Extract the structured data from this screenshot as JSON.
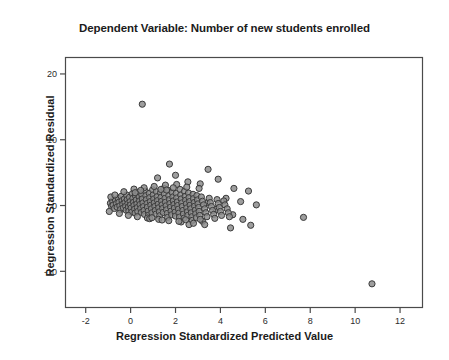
{
  "chart_data": {
    "type": "scatter",
    "title": "Dependent Variable: Number of new students enrolled",
    "xlabel": "Regression Standardized Predicted Value",
    "ylabel": "Regression Standardized Residual",
    "xlim": [
      -2.9,
      13.0
    ],
    "ylim": [
      -15.5,
      22.5
    ],
    "xticks": [
      -2,
      0,
      2,
      4,
      6,
      8,
      10,
      12
    ],
    "xtick_labels": [
      "-2",
      "0",
      "2",
      "4",
      "6",
      "8",
      "10",
      "12"
    ],
    "yticks": [
      20,
      10,
      0,
      -10
    ],
    "ytick_labels": [
      "20",
      "10",
      "0",
      "-10"
    ],
    "grid": false,
    "legend": null,
    "marker": {
      "shape": "circle",
      "fill": "#8d8d8d",
      "stroke": "#3a3a3a",
      "radius": 3.1,
      "stroke_width": 1.0
    },
    "frame_color": "#4a4a4a",
    "points": [
      [
        0.52,
        15.4
      ],
      [
        1.73,
        6.3
      ],
      [
        3.45,
        5.5
      ],
      [
        1.2,
        4.2
      ],
      [
        2.0,
        4.6
      ],
      [
        2.55,
        3.6
      ],
      [
        3.1,
        3.3
      ],
      [
        3.9,
        4.0
      ],
      [
        4.6,
        2.6
      ],
      [
        5.25,
        2.2
      ],
      [
        4.25,
        1.1
      ],
      [
        4.9,
        0.6
      ],
      [
        5.6,
        0.1
      ],
      [
        3.4,
        0.4
      ],
      [
        3.8,
        -0.6
      ],
      [
        4.55,
        -1.4
      ],
      [
        5.0,
        -2.1
      ],
      [
        5.35,
        -3.0
      ],
      [
        4.45,
        -3.4
      ],
      [
        3.2,
        -2.4
      ],
      [
        2.6,
        -2.9
      ],
      [
        7.7,
        -1.8
      ],
      [
        10.75,
        -11.9
      ],
      [
        -0.9,
        0.35
      ],
      [
        -0.85,
        -0.1
      ],
      [
        -0.8,
        0.7
      ],
      [
        -0.78,
        0.05
      ],
      [
        -0.72,
        -0.45
      ],
      [
        -0.68,
        0.9
      ],
      [
        -0.63,
        0.3
      ],
      [
        -0.6,
        -0.25
      ],
      [
        -0.55,
        1.1
      ],
      [
        -0.52,
        0.5
      ],
      [
        -0.48,
        -0.05
      ],
      [
        -0.45,
        -0.6
      ],
      [
        -0.42,
        1.4
      ],
      [
        -0.38,
        0.75
      ],
      [
        -0.35,
        0.2
      ],
      [
        -0.32,
        -0.35
      ],
      [
        -0.28,
        1.0
      ],
      [
        -0.25,
        0.45
      ],
      [
        -0.22,
        -0.1
      ],
      [
        -0.2,
        -0.7
      ],
      [
        -0.18,
        1.6
      ],
      [
        -0.15,
        0.9
      ],
      [
        -0.12,
        0.3
      ],
      [
        -0.1,
        -0.25
      ],
      [
        -0.08,
        -0.85
      ],
      [
        -0.05,
        1.25
      ],
      [
        -0.02,
        0.6
      ],
      [
        0.0,
        0.1
      ],
      [
        0.02,
        -0.4
      ],
      [
        0.05,
        -1.0
      ],
      [
        0.08,
        1.8
      ],
      [
        0.1,
        1.1
      ],
      [
        0.13,
        0.5
      ],
      [
        0.15,
        0.0
      ],
      [
        0.18,
        -0.55
      ],
      [
        0.2,
        -1.15
      ],
      [
        0.22,
        1.45
      ],
      [
        0.25,
        0.85
      ],
      [
        0.28,
        0.25
      ],
      [
        0.3,
        -0.3
      ],
      [
        0.32,
        -0.9
      ],
      [
        0.35,
        2.0
      ],
      [
        0.38,
        1.3
      ],
      [
        0.4,
        0.7
      ],
      [
        0.42,
        0.15
      ],
      [
        0.45,
        -0.45
      ],
      [
        0.48,
        -1.05
      ],
      [
        0.5,
        1.65
      ],
      [
        0.52,
        1.0
      ],
      [
        0.55,
        0.4
      ],
      [
        0.58,
        -0.15
      ],
      [
        0.6,
        -0.75
      ],
      [
        0.62,
        -1.35
      ],
      [
        0.65,
        2.2
      ],
      [
        0.68,
        1.5
      ],
      [
        0.7,
        0.9
      ],
      [
        0.73,
        0.3
      ],
      [
        0.75,
        -0.25
      ],
      [
        0.78,
        -0.85
      ],
      [
        0.8,
        -1.45
      ],
      [
        0.83,
        1.85
      ],
      [
        0.85,
        1.2
      ],
      [
        0.88,
        0.6
      ],
      [
        0.9,
        0.05
      ],
      [
        0.93,
        -0.5
      ],
      [
        0.95,
        -1.1
      ],
      [
        0.98,
        2.4
      ],
      [
        1.0,
        1.6
      ],
      [
        1.03,
        1.0
      ],
      [
        1.05,
        0.4
      ],
      [
        1.08,
        -0.15
      ],
      [
        1.1,
        -0.75
      ],
      [
        1.13,
        -1.3
      ],
      [
        1.15,
        2.1
      ],
      [
        1.18,
        1.35
      ],
      [
        1.2,
        0.75
      ],
      [
        1.23,
        0.2
      ],
      [
        1.25,
        -0.35
      ],
      [
        1.28,
        -0.95
      ],
      [
        1.3,
        -1.55
      ],
      [
        1.33,
        1.95
      ],
      [
        1.35,
        1.25
      ],
      [
        1.38,
        0.65
      ],
      [
        1.4,
        0.1
      ],
      [
        1.43,
        -0.45
      ],
      [
        1.45,
        -1.05
      ],
      [
        1.48,
        2.6
      ],
      [
        1.5,
        1.75
      ],
      [
        1.53,
        1.1
      ],
      [
        1.55,
        0.5
      ],
      [
        1.58,
        -0.05
      ],
      [
        1.6,
        -0.65
      ],
      [
        1.63,
        -1.2
      ],
      [
        1.65,
        -1.8
      ],
      [
        1.68,
        2.3
      ],
      [
        1.7,
        1.5
      ],
      [
        1.73,
        0.9
      ],
      [
        1.75,
        0.3
      ],
      [
        1.78,
        -0.25
      ],
      [
        1.8,
        -0.85
      ],
      [
        1.83,
        -1.4
      ],
      [
        1.85,
        2.0
      ],
      [
        1.88,
        1.3
      ],
      [
        1.9,
        0.7
      ],
      [
        1.93,
        0.15
      ],
      [
        1.95,
        -0.4
      ],
      [
        1.98,
        -1.0
      ],
      [
        2.0,
        -1.6
      ],
      [
        2.03,
        1.85
      ],
      [
        2.05,
        1.15
      ],
      [
        2.08,
        0.55
      ],
      [
        2.1,
        0.0
      ],
      [
        2.13,
        -0.55
      ],
      [
        2.15,
        -1.15
      ],
      [
        2.18,
        -1.75
      ],
      [
        2.2,
        2.45
      ],
      [
        2.23,
        1.6
      ],
      [
        2.25,
        1.0
      ],
      [
        2.28,
        0.4
      ],
      [
        2.3,
        -0.15
      ],
      [
        2.33,
        -0.75
      ],
      [
        2.35,
        -1.3
      ],
      [
        2.38,
        -1.9
      ],
      [
        2.4,
        2.15
      ],
      [
        2.43,
        1.4
      ],
      [
        2.45,
        0.8
      ],
      [
        2.48,
        0.25
      ],
      [
        2.5,
        -0.35
      ],
      [
        2.53,
        -0.95
      ],
      [
        2.55,
        -1.5
      ],
      [
        2.58,
        1.9
      ],
      [
        2.6,
        1.2
      ],
      [
        2.63,
        0.6
      ],
      [
        2.65,
        0.05
      ],
      [
        2.68,
        -0.5
      ],
      [
        2.7,
        -1.1
      ],
      [
        2.73,
        -1.7
      ],
      [
        2.75,
        -2.25
      ],
      [
        2.78,
        1.7
      ],
      [
        2.8,
        1.05
      ],
      [
        2.83,
        0.45
      ],
      [
        2.85,
        -0.1
      ],
      [
        2.88,
        -0.7
      ],
      [
        2.9,
        -1.25
      ],
      [
        2.93,
        -1.85
      ],
      [
        2.95,
        1.5
      ],
      [
        2.98,
        0.85
      ],
      [
        3.0,
        0.25
      ],
      [
        3.03,
        -0.3
      ],
      [
        3.05,
        -0.9
      ],
      [
        3.08,
        -1.5
      ],
      [
        3.1,
        -2.1
      ],
      [
        3.15,
        1.3
      ],
      [
        3.2,
        0.65
      ],
      [
        3.25,
        0.1
      ],
      [
        3.3,
        -0.5
      ],
      [
        3.35,
        -1.1
      ],
      [
        3.4,
        -1.7
      ],
      [
        3.5,
        1.1
      ],
      [
        3.55,
        0.45
      ],
      [
        3.6,
        -0.15
      ],
      [
        3.65,
        -0.75
      ],
      [
        3.7,
        -1.35
      ],
      [
        3.75,
        -1.95
      ],
      [
        3.85,
        0.9
      ],
      [
        3.9,
        0.3
      ],
      [
        3.95,
        -0.3
      ],
      [
        4.0,
        -0.9
      ],
      [
        4.05,
        -1.5
      ],
      [
        4.15,
        0.7
      ],
      [
        4.2,
        0.1
      ],
      [
        4.3,
        -0.5
      ],
      [
        4.35,
        -1.1
      ],
      [
        4.4,
        -1.7
      ],
      [
        -0.95,
        -0.9
      ],
      [
        -0.88,
        1.3
      ],
      [
        -0.7,
        1.6
      ],
      [
        -0.5,
        -1.2
      ],
      [
        -0.3,
        2.1
      ],
      [
        -0.1,
        -1.5
      ],
      [
        0.15,
        2.5
      ],
      [
        0.3,
        -1.7
      ],
      [
        0.6,
        2.7
      ],
      [
        0.75,
        -1.9
      ],
      [
        1.05,
        2.9
      ],
      [
        1.25,
        -2.1
      ],
      [
        1.55,
        3.1
      ],
      [
        1.7,
        -2.3
      ],
      [
        2.05,
        3.2
      ],
      [
        2.25,
        -2.5
      ],
      [
        2.5,
        2.8
      ],
      [
        2.8,
        -2.7
      ],
      [
        3.05,
        2.6
      ],
      [
        3.3,
        -2.9
      ],
      [
        1.9,
        2.7
      ],
      [
        0.85,
        -2.0
      ],
      [
        1.4,
        -2.2
      ],
      [
        0.45,
        2.3
      ],
      [
        2.15,
        -2.4
      ],
      [
        0.2,
        1.95
      ],
      [
        1.6,
        2.35
      ],
      [
        2.45,
        -2.15
      ],
      [
        0.95,
        -1.85
      ],
      [
        1.35,
        2.45
      ]
    ]
  }
}
